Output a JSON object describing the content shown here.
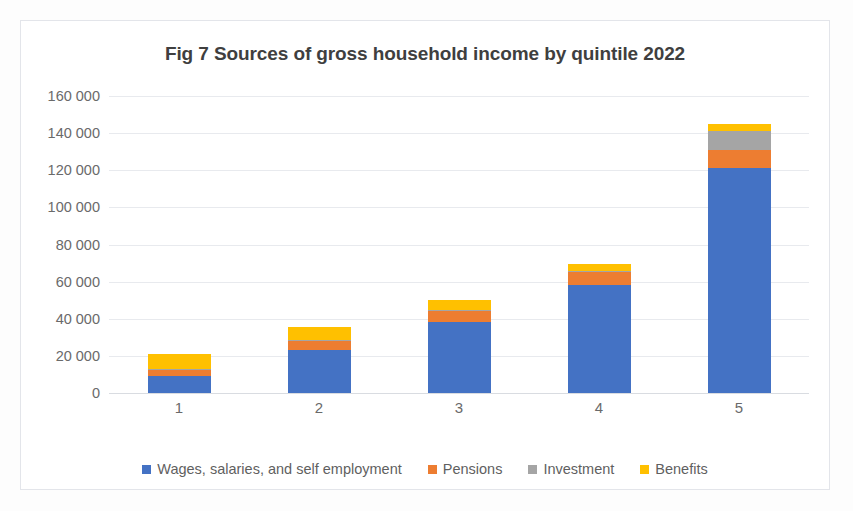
{
  "chart_data": {
    "type": "bar",
    "subtype": "stacked-column",
    "title": "Fig 7 Sources of gross household income by quintile 2022",
    "xlabel": "",
    "ylabel": "",
    "categories": [
      "1",
      "2",
      "3",
      "4",
      "5"
    ],
    "ytick_labels": [
      "0",
      "20 000",
      "40 000",
      "60 000",
      "80 000",
      "100 000",
      "120 000",
      "140 000",
      "160 000"
    ],
    "ytick_values": [
      0,
      20000,
      40000,
      60000,
      80000,
      100000,
      120000,
      140000,
      160000
    ],
    "ylim": [
      0,
      160000
    ],
    "grid": true,
    "legend_position": "bottom",
    "series": [
      {
        "name": "Wages, salaries, and self employment",
        "color": "#4472C4",
        "values": [
          9000,
          23000,
          38000,
          58000,
          121000
        ]
      },
      {
        "name": "Pensions",
        "color": "#ED7D31",
        "values": [
          3500,
          5000,
          6000,
          7000,
          10000
        ]
      },
      {
        "name": "Investment",
        "color": "#A5A5A5",
        "values": [
          500,
          500,
          700,
          1000,
          10000
        ]
      },
      {
        "name": "Benefits",
        "color": "#FFC000",
        "values": [
          8000,
          7000,
          5500,
          3500,
          4000
        ]
      }
    ],
    "totals": [
      21000,
      35500,
      50200,
      69500,
      145000
    ]
  }
}
